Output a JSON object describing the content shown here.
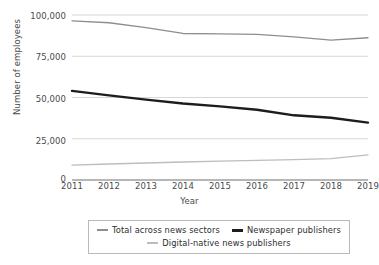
{
  "chart_data": {
    "type": "line",
    "title": "",
    "xlabel": "Year",
    "ylabel": "Number of employees",
    "x": [
      2011,
      2012,
      2013,
      2014,
      2015,
      2016,
      2017,
      2018,
      2019
    ],
    "xticklabels": [
      "2011",
      "2012",
      "2013",
      "2014",
      "2015",
      "2016",
      "2017",
      "2018",
      "2019"
    ],
    "yticks": [
      0,
      25000,
      50000,
      75000,
      100000
    ],
    "yticklabels": [
      "0",
      "25,000",
      "50,000",
      "75,000",
      "100,000"
    ],
    "ylim": [
      0,
      100000
    ],
    "xlim": [
      2011,
      2019
    ],
    "grid": "horizontal",
    "legend_position": "below",
    "series": [
      {
        "name": "Total across news sectors",
        "color": "#8e8e8e",
        "linewidth": 1.3,
        "values": [
          96500,
          95300,
          92400,
          88800,
          88600,
          88200,
          86700,
          84800,
          86200
        ]
      },
      {
        "name": "Newspaper publishers",
        "color": "#1d1d1d",
        "linewidth": 2.4,
        "values": [
          54000,
          51300,
          48700,
          46400,
          44600,
          42600,
          39200,
          37700,
          34800
        ]
      },
      {
        "name": "Digital-native news publishers",
        "color": "#bdbdbd",
        "linewidth": 1.3,
        "values": [
          9000,
          9700,
          10300,
          10900,
          11400,
          11900,
          12400,
          13000,
          15200
        ]
      }
    ]
  },
  "axes": {
    "y_title": "Number of employees",
    "x_title": "Year"
  },
  "legend": {
    "row1": [
      {
        "label": "Total across news sectors",
        "swatch": "line-swatch-total"
      },
      {
        "label": "Newspaper publishers",
        "swatch": "line-swatch-newspaper"
      }
    ],
    "row2": [
      {
        "label": "Digital-native news publishers",
        "swatch": "line-swatch-digital"
      }
    ]
  },
  "colors": {
    "total": "#8e8e8e",
    "newspaper": "#1d1d1d",
    "digital": "#bdbdbd",
    "grid": "#d7d7d7",
    "axis": "#6f6f6f",
    "text": "#4a4a4a"
  }
}
